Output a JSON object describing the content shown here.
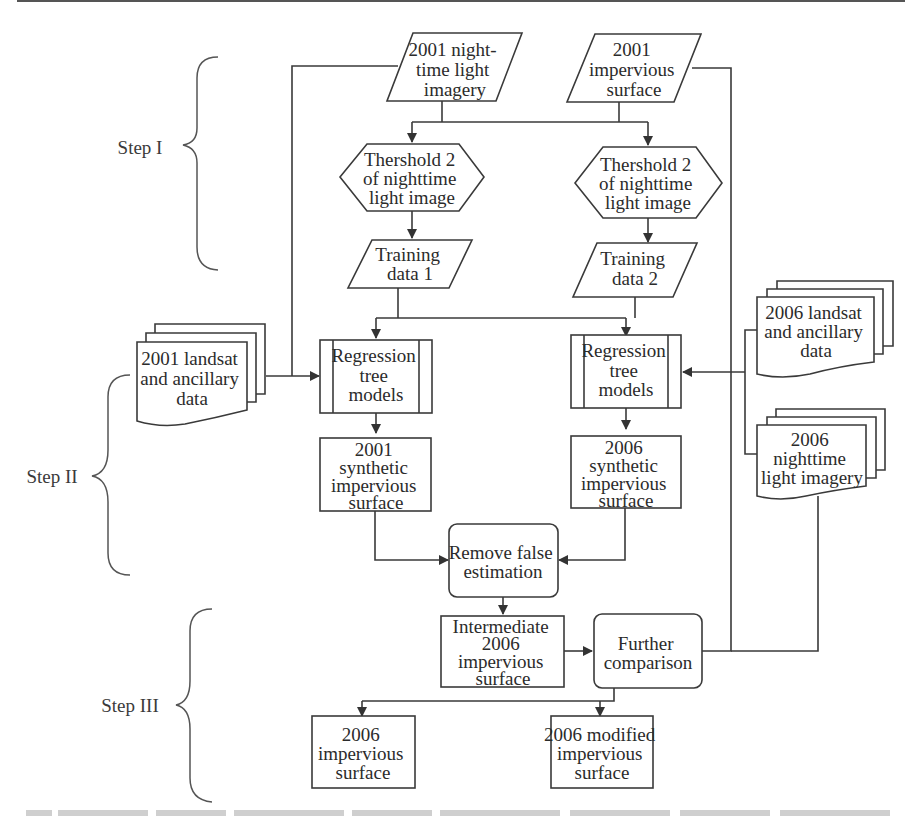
{
  "figure": {
    "type": "flowchart",
    "steps": [
      {
        "id": "step1",
        "label": "Step I"
      },
      {
        "id": "step2",
        "label": "Step II"
      },
      {
        "id": "step3",
        "label": "Step III"
      }
    ],
    "nodes": {
      "nightlight_2001": {
        "shape": "parallelogram",
        "lines": [
          "2001 night-",
          "time light",
          "imagery"
        ]
      },
      "impervious_2001": {
        "shape": "parallelogram",
        "lines": [
          "2001",
          "impervious",
          "surface"
        ]
      },
      "threshold_1": {
        "shape": "hexagon",
        "lines": [
          "Thershold 2",
          "of nighttime",
          "light image"
        ]
      },
      "threshold_2": {
        "shape": "hexagon",
        "lines": [
          "Thershold 2",
          "of nighttime",
          "light image"
        ]
      },
      "training_1": {
        "shape": "parallelogram",
        "lines": [
          "Training",
          "data 1"
        ]
      },
      "training_2": {
        "shape": "parallelogram",
        "lines": [
          "Training",
          "data 2"
        ]
      },
      "landsat_2001": {
        "shape": "multi-document",
        "lines": [
          "2001 landsat",
          "and ancillary",
          "data"
        ]
      },
      "landsat_2006": {
        "shape": "multi-document",
        "lines": [
          "2006 landsat",
          "and ancillary",
          "data"
        ]
      },
      "nightlight_2006": {
        "shape": "multi-document",
        "lines": [
          "2006",
          "nighttime",
          "light imagery"
        ]
      },
      "regression_1": {
        "shape": "predefined-process",
        "lines": [
          "Regression",
          "tree",
          "models"
        ]
      },
      "regression_2": {
        "shape": "predefined-process",
        "lines": [
          "Regression",
          "tree",
          "models"
        ]
      },
      "synthetic_2001": {
        "shape": "rectangle",
        "lines": [
          "2001",
          "synthetic",
          "impervious",
          "surface"
        ]
      },
      "synthetic_2006": {
        "shape": "rectangle",
        "lines": [
          "2006",
          "synthetic",
          "impervious",
          "surface"
        ]
      },
      "remove_false": {
        "shape": "rounded-rectangle",
        "lines": [
          "Remove false",
          "estimation"
        ]
      },
      "intermediate_2006": {
        "shape": "rectangle",
        "lines": [
          "Intermediate",
          "2006",
          "impervious",
          "surface"
        ]
      },
      "further_comparison": {
        "shape": "rounded-rectangle",
        "lines": [
          "Further",
          "comparison"
        ]
      },
      "impervious_2006": {
        "shape": "rectangle",
        "lines": [
          "2006",
          "impervious",
          "surface"
        ]
      },
      "modified_2006": {
        "shape": "rectangle",
        "lines": [
          "2006 modified",
          "impervious",
          "surface"
        ]
      }
    },
    "edges": [
      {
        "from": "nightlight_2001",
        "to": "threshold_1"
      },
      {
        "from": "nightlight_2001",
        "to": "threshold_2"
      },
      {
        "from": "impervious_2001",
        "to": "threshold_1"
      },
      {
        "from": "impervious_2001",
        "to": "threshold_2"
      },
      {
        "from": "threshold_1",
        "to": "training_1"
      },
      {
        "from": "threshold_2",
        "to": "training_2"
      },
      {
        "from": "training_1",
        "to": "regression_1"
      },
      {
        "from": "training_1",
        "to": "regression_2"
      },
      {
        "from": "training_2",
        "to": "regression_1"
      },
      {
        "from": "training_2",
        "to": "regression_2"
      },
      {
        "from": "nightlight_2001",
        "to": "regression_1"
      },
      {
        "from": "landsat_2001",
        "to": "regression_1"
      },
      {
        "from": "landsat_2006",
        "to": "regression_2"
      },
      {
        "from": "nightlight_2006",
        "to": "regression_2"
      },
      {
        "from": "impervious_2001",
        "to": "further_comparison"
      },
      {
        "from": "nightlight_2006",
        "to": "further_comparison"
      },
      {
        "from": "regression_1",
        "to": "synthetic_2001"
      },
      {
        "from": "regression_2",
        "to": "synthetic_2006"
      },
      {
        "from": "synthetic_2001",
        "to": "remove_false"
      },
      {
        "from": "synthetic_2006",
        "to": "remove_false"
      },
      {
        "from": "remove_false",
        "to": "intermediate_2006"
      },
      {
        "from": "intermediate_2006",
        "to": "further_comparison"
      },
      {
        "from": "further_comparison",
        "to": "impervious_2006"
      },
      {
        "from": "further_comparison",
        "to": "modified_2006"
      }
    ]
  },
  "caption": {
    "visible": "partially cut off, illegible"
  }
}
